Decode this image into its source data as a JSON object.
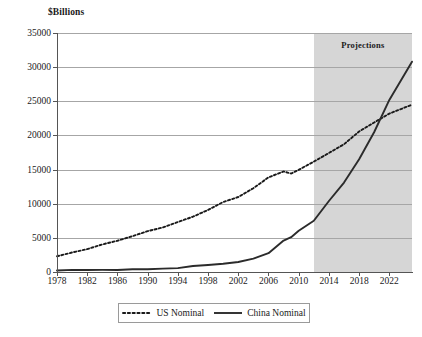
{
  "chart_data": {
    "type": "line",
    "title": "",
    "ylabel": "$Billions",
    "xlabel": "",
    "ylim": [
      0,
      35000
    ],
    "xlim": [
      1978,
      2025
    ],
    "grid": true,
    "y_ticks": [
      0,
      5000,
      10000,
      15000,
      20000,
      25000,
      30000,
      35000
    ],
    "y_tick_labels": [
      "0",
      "5000",
      "10000",
      "15000",
      "20000",
      "25000",
      "30000",
      "35000"
    ],
    "x_ticks": [
      1978,
      1982,
      1986,
      1990,
      1994,
      1998,
      2002,
      2006,
      2010,
      2014,
      2018,
      2022
    ],
    "x_tick_labels": [
      "1978",
      "1982",
      "1986",
      "1990",
      "1994",
      "1998",
      "2002",
      "2006",
      "2010",
      "2014",
      "2018",
      "2022"
    ],
    "annotations": [
      {
        "text": "Projections",
        "x_start": 2012,
        "x_end": 2025,
        "note": "shaded region covering forecast years"
      }
    ],
    "legend_position": "bottom-center",
    "series": [
      {
        "name": "US Nominal",
        "style": "dotted",
        "color": "#1a1a1a",
        "x": [
          1978,
          1980,
          1982,
          1984,
          1986,
          1988,
          1990,
          1992,
          1994,
          1996,
          1998,
          2000,
          2002,
          2004,
          2006,
          2008,
          2009,
          2010,
          2012,
          2014,
          2016,
          2018,
          2020,
          2022,
          2025
        ],
        "values": [
          2300,
          2860,
          3350,
          4040,
          4580,
          5250,
          5980,
          6520,
          7310,
          8100,
          9090,
          10250,
          10980,
          12270,
          13860,
          14720,
          14420,
          14960,
          16160,
          17430,
          18710,
          20580,
          21900,
          23200,
          24500
        ]
      },
      {
        "name": "China Nominal",
        "style": "solid",
        "color": "#2b2b2b",
        "x": [
          1978,
          1980,
          1982,
          1984,
          1986,
          1988,
          1990,
          1992,
          1994,
          1996,
          1998,
          2000,
          2002,
          2004,
          2006,
          2008,
          2009,
          2010,
          2012,
          2014,
          2016,
          2018,
          2020,
          2022,
          2025
        ],
        "values": [
          220,
          310,
          290,
          310,
          300,
          410,
          400,
          490,
          570,
          870,
          1030,
          1210,
          1470,
          1960,
          2750,
          4600,
          5100,
          6040,
          7500,
          10400,
          13100,
          16500,
          20500,
          25200,
          30800
        ]
      }
    ]
  },
  "legend": {
    "items": [
      {
        "label": "US Nominal",
        "marker": "dotted-line-swatch"
      },
      {
        "label": "China Nominal",
        "marker": "solid-line-swatch"
      }
    ]
  }
}
